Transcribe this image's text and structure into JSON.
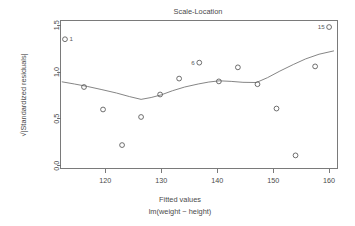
{
  "chart_data": {
    "type": "scatter",
    "title": "Scale-Location",
    "xlabel": "Fitted values",
    "sublabel": "lm(weight ~ height)",
    "ylabel": "√|Standardized residuals|",
    "xlim": [
      112,
      161.5
    ],
    "ylim": [
      -0.03,
      1.55
    ],
    "xticks": [
      120,
      130,
      140,
      150,
      160
    ],
    "yticks": [
      "0.0",
      "0.5",
      "1.0",
      "1.5"
    ],
    "ytick_values": [
      0.0,
      0.5,
      1.0,
      1.5
    ],
    "grid": false,
    "legend": "none",
    "points": [
      {
        "x": 112.8,
        "y": 1.35,
        "label": "1"
      },
      {
        "x": 116.2,
        "y": 0.84,
        "label": ""
      },
      {
        "x": 119.6,
        "y": 0.6,
        "label": ""
      },
      {
        "x": 123.0,
        "y": 0.22,
        "label": ""
      },
      {
        "x": 126.4,
        "y": 0.52,
        "label": ""
      },
      {
        "x": 129.8,
        "y": 0.76,
        "label": ""
      },
      {
        "x": 133.2,
        "y": 0.93,
        "label": ""
      },
      {
        "x": 136.8,
        "y": 1.1,
        "label": "6"
      },
      {
        "x": 140.3,
        "y": 0.9,
        "label": ""
      },
      {
        "x": 143.7,
        "y": 1.05,
        "label": ""
      },
      {
        "x": 147.2,
        "y": 0.87,
        "label": ""
      },
      {
        "x": 150.6,
        "y": 0.61,
        "label": ""
      },
      {
        "x": 154.0,
        "y": 0.11,
        "label": ""
      },
      {
        "x": 157.5,
        "y": 1.06,
        "label": ""
      },
      {
        "x": 160.0,
        "y": 1.48,
        "label": "15"
      }
    ],
    "smooth": [
      {
        "x": 112.3,
        "y": 0.895
      },
      {
        "x": 114.5,
        "y": 0.872
      },
      {
        "x": 116.8,
        "y": 0.846
      },
      {
        "x": 119.4,
        "y": 0.812
      },
      {
        "x": 122.0,
        "y": 0.776
      },
      {
        "x": 124.3,
        "y": 0.738
      },
      {
        "x": 126.4,
        "y": 0.708
      },
      {
        "x": 128.2,
        "y": 0.728
      },
      {
        "x": 130.0,
        "y": 0.756
      },
      {
        "x": 132.0,
        "y": 0.8
      },
      {
        "x": 134.2,
        "y": 0.84
      },
      {
        "x": 136.6,
        "y": 0.872
      },
      {
        "x": 138.5,
        "y": 0.893
      },
      {
        "x": 140.4,
        "y": 0.906
      },
      {
        "x": 142.5,
        "y": 0.9
      },
      {
        "x": 144.6,
        "y": 0.89
      },
      {
        "x": 147.0,
        "y": 0.888
      },
      {
        "x": 149.0,
        "y": 0.94
      },
      {
        "x": 151.2,
        "y": 1.01
      },
      {
        "x": 153.6,
        "y": 1.08
      },
      {
        "x": 155.8,
        "y": 1.14
      },
      {
        "x": 158.2,
        "y": 1.19
      },
      {
        "x": 160.8,
        "y": 1.225
      }
    ]
  },
  "labels": {
    "title": "Scale-Location",
    "xaxis_title": "Fitted values",
    "xaxis_subtitle": "lm(weight ~ height)",
    "yaxis_title": "|Standardized residuals|",
    "yaxis_radical": "√",
    "point_label_1": "1",
    "point_label_6": "6",
    "point_label_15": "15",
    "xtick_120": "120",
    "xtick_130": "130",
    "xtick_140": "140",
    "xtick_150": "150",
    "xtick_160": "160",
    "ytick_00": "0.0",
    "ytick_05": "0.5",
    "ytick_10": "1.0",
    "ytick_15": "1.5"
  },
  "colors": {
    "axis": "#6b6b6b",
    "point": "#555555",
    "line": "#777777",
    "text": "#4a4a4a",
    "background": "#ffffff"
  }
}
